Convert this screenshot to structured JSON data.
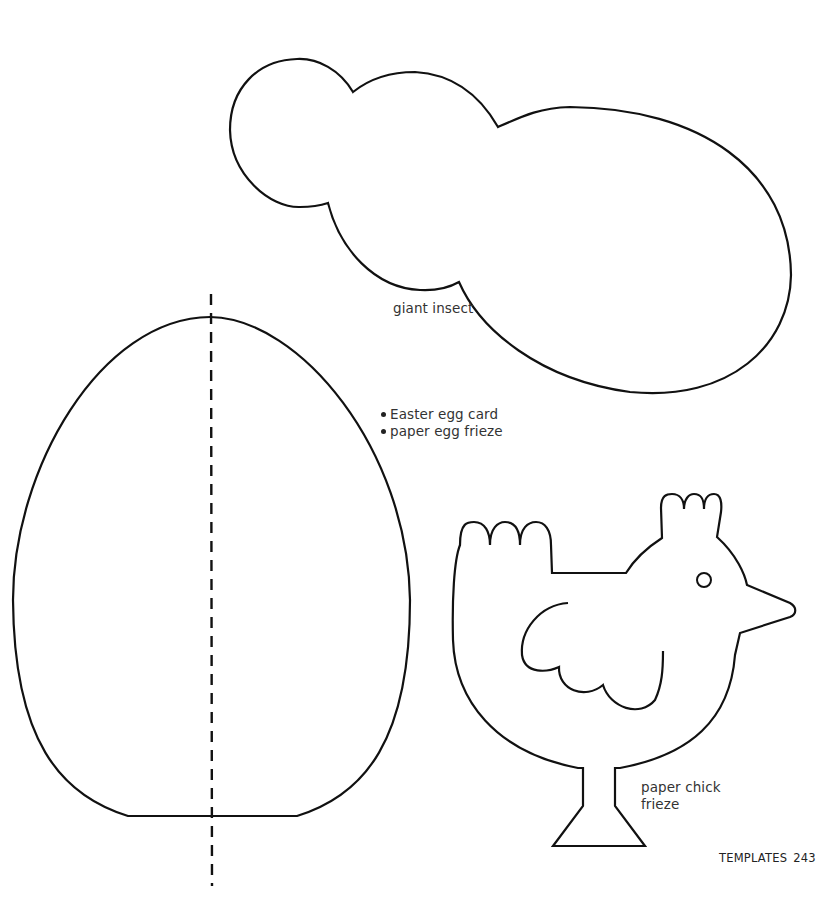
{
  "page": {
    "section": "TEMPLATES",
    "page_number": "243"
  },
  "templates": {
    "insect": {
      "label": "giant insect",
      "stroke": "#111111"
    },
    "egg": {
      "uses": [
        "Easter egg card",
        "paper egg frieze"
      ],
      "fold_line": "dashed-center",
      "stroke": "#111111"
    },
    "chick": {
      "label_line1": "paper chick",
      "label_line2": "frieze",
      "stroke": "#111111"
    }
  }
}
